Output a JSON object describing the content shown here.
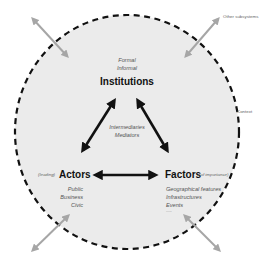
{
  "diagram": {
    "colors": {
      "background": "#ffffff",
      "circle_fill": "#ebebeb",
      "circle_border": "#111111",
      "inner_arrows": "#111111",
      "outer_arrows": "#a6a6a6",
      "text_dark": "#111111",
      "text_muted": "#555555"
    },
    "context_label": "Context",
    "other_subsystems_label": "Other subsystems",
    "institutions": {
      "title": "Institutions",
      "subitems": [
        "Formal",
        "Informal"
      ]
    },
    "intermediaries": {
      "lines": [
        "Intermediaries",
        "Mediators"
      ]
    },
    "actors": {
      "prefix": "(leading)",
      "title": "Actors",
      "subitems": [
        "Public",
        "Business",
        "Civic"
      ]
    },
    "factors": {
      "title": "Factors",
      "suffix": "(of importance)",
      "subitems": [
        "Geographical features",
        "Infrastructures",
        "Events"
      ],
      "more": "......"
    },
    "relations": [
      {
        "from": "Institutions",
        "to": "Actors",
        "type": "bidirectional"
      },
      {
        "from": "Institutions",
        "to": "Factors",
        "type": "bidirectional"
      },
      {
        "from": "Actors",
        "to": "Factors",
        "type": "bidirectional"
      }
    ],
    "external_links": [
      {
        "position": "top-left",
        "type": "bidirectional"
      },
      {
        "position": "top-right",
        "type": "bidirectional",
        "label": "Other subsystems"
      },
      {
        "position": "bottom-left",
        "type": "bidirectional"
      },
      {
        "position": "bottom-right",
        "type": "bidirectional"
      }
    ]
  }
}
